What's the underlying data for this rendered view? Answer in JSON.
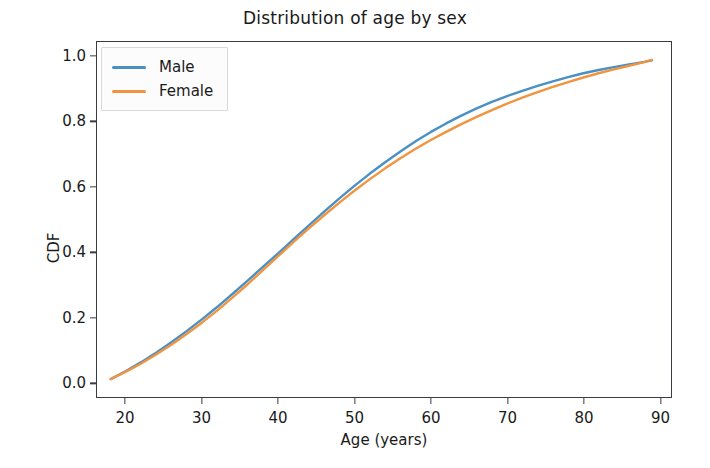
{
  "chart_data": {
    "type": "line",
    "title": "Distribution of age by sex",
    "xlabel": "Age (years)",
    "ylabel": "CDF",
    "xlim": [
      16.2,
      91.5
    ],
    "ylim": [
      -0.045,
      1.045
    ],
    "xticks": [
      20,
      30,
      40,
      50,
      60,
      70,
      80,
      90
    ],
    "xticklabels": [
      "20",
      "30",
      "40",
      "50",
      "60",
      "70",
      "80",
      "90"
    ],
    "yticks": [
      0.0,
      0.2,
      0.4,
      0.6,
      0.8,
      1.0
    ],
    "yticklabels": [
      "0.0",
      "0.2",
      "0.4",
      "0.6",
      "0.8",
      "1.0"
    ],
    "grid": false,
    "legend_position": "upper left",
    "colors": {
      "male": "#4a90c4",
      "female": "#f0943f",
      "axes": "#3b3b42",
      "text": "#1a1a1a",
      "background": "#ffffff"
    },
    "x": [
      18,
      20,
      22,
      24,
      26,
      28,
      30,
      32,
      34,
      36,
      38,
      40,
      42,
      44,
      46,
      48,
      50,
      52,
      54,
      56,
      58,
      60,
      62,
      64,
      66,
      68,
      70,
      72,
      74,
      76,
      78,
      80,
      82,
      84,
      86,
      88,
      89
    ],
    "series": [
      {
        "name": "Male",
        "color": "#4a90c4",
        "values": [
          0.01,
          0.035,
          0.062,
          0.092,
          0.124,
          0.158,
          0.194,
          0.232,
          0.272,
          0.313,
          0.355,
          0.397,
          0.44,
          0.482,
          0.524,
          0.565,
          0.604,
          0.641,
          0.676,
          0.709,
          0.74,
          0.769,
          0.795,
          0.819,
          0.841,
          0.861,
          0.879,
          0.895,
          0.91,
          0.924,
          0.937,
          0.949,
          0.959,
          0.968,
          0.976,
          0.984,
          0.989
        ]
      },
      {
        "name": "Female",
        "color": "#f0943f",
        "values": [
          0.01,
          0.033,
          0.058,
          0.086,
          0.116,
          0.149,
          0.184,
          0.221,
          0.261,
          0.302,
          0.345,
          0.388,
          0.431,
          0.473,
          0.513,
          0.552,
          0.589,
          0.624,
          0.657,
          0.688,
          0.717,
          0.744,
          0.769,
          0.793,
          0.815,
          0.836,
          0.856,
          0.874,
          0.891,
          0.907,
          0.922,
          0.936,
          0.949,
          0.961,
          0.972,
          0.983,
          0.99
        ]
      }
    ]
  },
  "legend": {
    "entries": [
      {
        "label": "Male",
        "color": "#4a90c4"
      },
      {
        "label": "Female",
        "color": "#f0943f"
      }
    ]
  }
}
